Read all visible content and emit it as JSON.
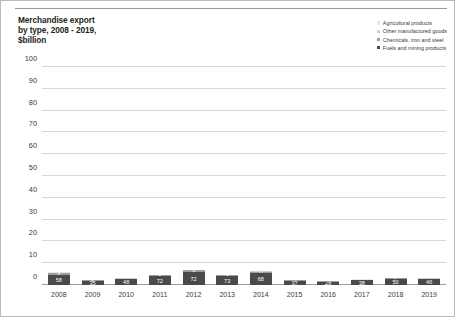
{
  "title": "Merchandise export\nby type, 2008 - 2019,\n$billion",
  "colors": {
    "agricultural": "#e8e8e8",
    "other_manufactured": "#cfcfcf",
    "chemicals": "#9d9d9d",
    "fuels_mining": "#4a4a4a",
    "gridline": "#d7d7d7",
    "axis": "#9e9e9e",
    "text": "#3a3a3a",
    "border": "#b9b9b9"
  },
  "legend": {
    "position": "top-right",
    "items": [
      {
        "label": "Agricultural products",
        "color": "#e8e8e8"
      },
      {
        "label": "Other manufactured goods",
        "color": "#cfcfcf"
      },
      {
        "label": "Chemicals, iron and steel",
        "color": "#9d9d9d"
      },
      {
        "label": "Fuels and mining products",
        "color": "#4a4a4a"
      }
    ]
  },
  "chart_data": {
    "type": "bar",
    "subtype": "stacked",
    "title": "Merchandise export by type, 2008 - 2019, $billion",
    "xlabel": "",
    "ylabel": "$billion",
    "ylim": [
      0,
      100
    ],
    "yticks": [
      0,
      10,
      20,
      30,
      40,
      50,
      60,
      70,
      80,
      90,
      100
    ],
    "ytick_labels": [
      "0",
      "10",
      "20",
      "30",
      "40",
      "50",
      "60",
      "70",
      "80",
      "90",
      "100"
    ],
    "grid": true,
    "categories": [
      "2008",
      "2009",
      "2010",
      "2011",
      "2012",
      "2013",
      "2014",
      "2015",
      "2016",
      "2017",
      "2018",
      "2019"
    ],
    "series": [
      {
        "name": "Fuels and mining products",
        "color": "#4a4a4a",
        "values": [
          58,
          35,
          48,
          72,
          72,
          73,
          68,
          37,
          28,
          38,
          50,
          46
        ],
        "labels": [
          "58",
          "35",
          "48",
          "72",
          "72",
          "73",
          "68",
          "37",
          "28",
          "38",
          "50",
          "46"
        ]
      },
      {
        "name": "Chemicals, iron and steel",
        "color": "#9d9d9d",
        "values": [
          8,
          5,
          6,
          8,
          9,
          8,
          6,
          5,
          5,
          5,
          6,
          6
        ],
        "labels": [
          "8",
          "5",
          "6",
          "8",
          "9",
          "8",
          "6",
          "5",
          "5",
          "5",
          "6",
          "6"
        ]
      },
      {
        "name": "Other manufactured goods",
        "color": "#cfcfcf",
        "values": [
          3,
          2,
          2,
          3,
          3,
          2,
          3,
          2,
          2,
          3,
          3,
          3
        ],
        "labels": [
          "3",
          "",
          "",
          "",
          "3",
          "",
          "3",
          "",
          "",
          "",
          "",
          ""
        ]
      },
      {
        "name": "Agricultural products",
        "color": "#e8e8e8",
        "values": [
          1,
          1,
          1,
          1,
          2,
          1,
          2,
          1,
          1,
          1,
          1,
          1
        ],
        "labels": [
          "",
          "",
          "",
          "",
          "",
          "",
          "",
          "",
          "",
          "",
          "",
          ""
        ]
      }
    ],
    "totals": [
      70,
      43,
      57,
      84,
      86,
      84,
      79,
      45,
      36,
      47,
      60,
      56
    ]
  }
}
